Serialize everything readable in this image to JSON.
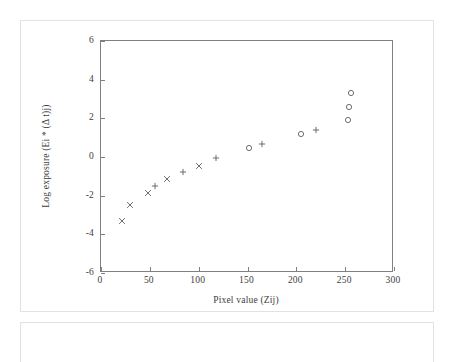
{
  "figure": {
    "name": "log-exposure-vs-pixel-value-plot"
  },
  "chart_data": {
    "type": "scatter",
    "title": "",
    "subtitle": "",
    "xlabel": "Pixel value (Zij)",
    "ylabel": "Log exposure (Ei * (Δ t)j)",
    "xlim": [
      0,
      300
    ],
    "ylim": [
      -6,
      6
    ],
    "xticks": [
      0,
      50,
      100,
      150,
      200,
      250,
      300
    ],
    "xticklabels": [
      "0",
      "50",
      "100",
      "150",
      "200",
      "250",
      "300"
    ],
    "yticks": [
      -6,
      -4,
      -2,
      0,
      2,
      4,
      6
    ],
    "yticklabels": [
      "-6",
      "-4",
      "-2",
      "0",
      "2",
      "4",
      "6"
    ],
    "grid": false,
    "legend": false,
    "legend_position": "none",
    "series": [
      {
        "name": "cross-markers",
        "marker": "x",
        "points": [
          {
            "x": 22,
            "y": -3.3
          },
          {
            "x": 30,
            "y": -2.5
          },
          {
            "x": 48,
            "y": -1.85
          },
          {
            "x": 68,
            "y": -1.15
          },
          {
            "x": 100,
            "y": -0.45
          }
        ]
      },
      {
        "name": "plus-markers",
        "marker": "+",
        "points": [
          {
            "x": 55,
            "y": -1.5
          },
          {
            "x": 84,
            "y": -0.8
          },
          {
            "x": 118,
            "y": -0.05
          },
          {
            "x": 165,
            "y": 0.65
          },
          {
            "x": 220,
            "y": 1.38
          }
        ]
      },
      {
        "name": "circle-markers",
        "marker": "o",
        "points": [
          {
            "x": 152,
            "y": 0.45
          },
          {
            "x": 205,
            "y": 1.18
          },
          {
            "x": 253,
            "y": 1.92
          },
          {
            "x": 254,
            "y": 2.6
          },
          {
            "x": 256,
            "y": 3.3
          }
        ]
      }
    ]
  }
}
